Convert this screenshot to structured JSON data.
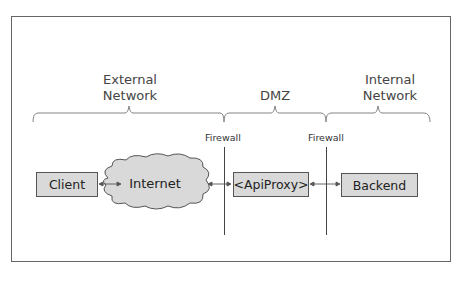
{
  "zones": [
    {
      "label_line1": "External",
      "label_line2": "Network"
    },
    {
      "label_line1": "DMZ",
      "label_line2": ""
    },
    {
      "label_line1": "Internal",
      "label_line2": "Network"
    }
  ],
  "firewalls": [
    {
      "label": "Firewall"
    },
    {
      "label": "Firewall"
    }
  ],
  "nodes": {
    "client": "Client",
    "internet": "Internet",
    "proxy": "<ApiProxy>",
    "backend": "Backend"
  },
  "colors": {
    "box_fill": "#d9d9d9",
    "stroke": "#555555"
  }
}
